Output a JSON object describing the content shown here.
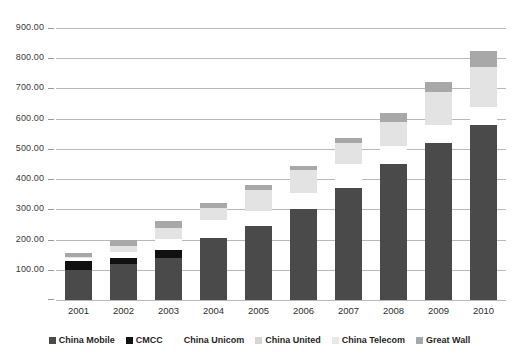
{
  "chart_data": {
    "type": "bar",
    "stacked": true,
    "title": "",
    "xlabel": "",
    "ylabel": "",
    "grid": true,
    "legend_position": "bottom",
    "ylim": [
      0,
      900
    ],
    "yticks": [
      100,
      200,
      300,
      400,
      500,
      600,
      700,
      800,
      900
    ],
    "ytick_labels": [
      "100.00",
      "200.00",
      "300.00",
      "400.00",
      "500.00",
      "600.00",
      "700.00",
      "800.00",
      "900.00"
    ],
    "categories": [
      "2001",
      "2002",
      "2003",
      "2004",
      "2005",
      "2006",
      "2007",
      "2008",
      "2009",
      "2010"
    ],
    "series": [
      {
        "name": "China Mobile",
        "color": "#4a4a4a",
        "values": [
          100,
          120,
          140,
          205,
          245,
          300,
          370,
          450,
          520,
          580
        ]
      },
      {
        "name": "CMCC",
        "color": "#111111",
        "values": [
          28,
          20,
          26,
          0,
          0,
          0,
          0,
          0,
          0,
          0
        ]
      },
      {
        "name": "China Unicom",
        "color": "#ffffff",
        "values": [
          10,
          20,
          36,
          60,
          50,
          55,
          80,
          60,
          60,
          60
        ]
      },
      {
        "name": "China United",
        "color": "#ebebeb",
        "values": [
          0,
          0,
          0,
          0,
          0,
          0,
          0,
          0,
          0,
          0
        ]
      },
      {
        "name": "China Telecom",
        "color": "#e3e3e3",
        "values": [
          5,
          20,
          38,
          40,
          70,
          75,
          70,
          80,
          110,
          130
        ]
      },
      {
        "name": "Great Wall",
        "color": "#a8a8a8",
        "values": [
          12,
          20,
          20,
          15,
          15,
          15,
          15,
          30,
          30,
          55
        ]
      }
    ],
    "totals": [
      155,
      200,
      260,
      320,
      380,
      445,
      535,
      620,
      720,
      825
    ]
  },
  "legend": {
    "items": [
      {
        "label": "China Mobile",
        "color": "#4a4a4a"
      },
      {
        "label": "CMCC",
        "color": "#111111"
      },
      {
        "label": "China Unicom",
        "color": "#fdfdfd"
      },
      {
        "label": "China United",
        "color": "#d6d6d6"
      },
      {
        "label": "China Telecom",
        "color": "#e8e8e8"
      },
      {
        "label": "Great Wall",
        "color": "#a8a8a8"
      }
    ]
  }
}
